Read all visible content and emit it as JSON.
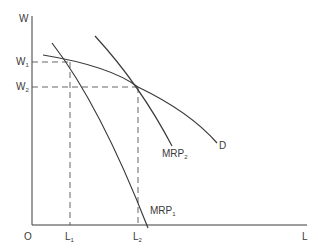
{
  "diagram": {
    "axes": {
      "y_label": "W",
      "x_label": "L",
      "origin_label": "O"
    },
    "y_ticks": [
      {
        "label": "W",
        "sub": "1"
      },
      {
        "label": "W",
        "sub": "2"
      }
    ],
    "x_ticks": [
      {
        "label": "L",
        "sub": "1"
      },
      {
        "label": "L",
        "sub": "2"
      }
    ],
    "curves": [
      {
        "name": "D",
        "label": "D",
        "sub": ""
      },
      {
        "name": "MRP2",
        "label": "MRP",
        "sub": "2"
      },
      {
        "name": "MRP1",
        "label": "MRP",
        "sub": "1"
      }
    ],
    "colors": {
      "line": "#3a3a3a",
      "dash": "#555555"
    }
  }
}
